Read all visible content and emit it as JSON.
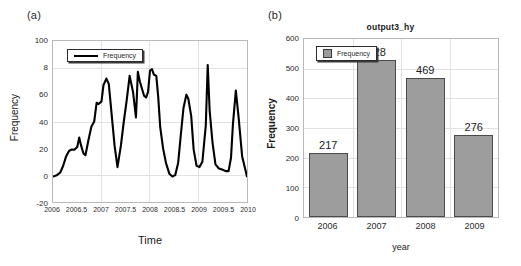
{
  "figure": {
    "panels": [
      {
        "tag": "(a)",
        "title": "",
        "legend_label": "Frequency",
        "xlabel": "Time",
        "ylabel": "Frequency"
      },
      {
        "tag": "(b)",
        "title": "output3_hy",
        "legend_label": "Frequency",
        "xlabel": "year",
        "ylabel": "Frequency"
      }
    ]
  },
  "colors": {
    "line": "#000000",
    "bar_fill": "#9d9d9d",
    "bar_edge": "#4a4a4a",
    "grid": "#e2e2e2",
    "frame": "#b9b9b9",
    "text": "#1a1a1a"
  },
  "chart_data": [
    {
      "type": "line",
      "panel": "(a)",
      "title": "",
      "xlabel": "Time",
      "ylabel": "Frequency",
      "xlim": [
        2006,
        2010
      ],
      "ylim": [
        -20,
        100
      ],
      "xticks": [
        2006,
        2006.5,
        2007,
        2007.5,
        2008,
        2008.5,
        2009,
        2009.5,
        2010
      ],
      "xticklabels": [
        "2006",
        "2006.5",
        "2007",
        "2007.5",
        "2008",
        "2008.5",
        "2009",
        "2009.5",
        "2010"
      ],
      "yticks": [
        -20,
        0,
        20,
        40,
        60,
        8,
        100
      ],
      "yticklabels": [
        "-20",
        "0",
        "20",
        "40",
        "60",
        "8",
        "100"
      ],
      "grid": true,
      "legend": {
        "position": "upper left",
        "entries": [
          "Frequency"
        ]
      },
      "series": [
        {
          "name": "Frequency",
          "x": [
            2006.0,
            2006.08,
            2006.15,
            2006.21,
            2006.27,
            2006.33,
            2006.38,
            2006.44,
            2006.5,
            2006.54,
            2006.58,
            2006.63,
            2006.67,
            2006.73,
            2006.79,
            2006.85,
            2006.9,
            2006.94,
            2007.0,
            2007.04,
            2007.1,
            2007.15,
            2007.21,
            2007.27,
            2007.33,
            2007.4,
            2007.46,
            2007.52,
            2007.58,
            2007.65,
            2007.71,
            2007.75,
            2007.79,
            2007.83,
            2007.88,
            2007.92,
            2007.96,
            2008.0,
            2008.04,
            2008.08,
            2008.13,
            2008.17,
            2008.21,
            2008.27,
            2008.33,
            2008.4,
            2008.46,
            2008.52,
            2008.58,
            2008.63,
            2008.69,
            2008.75,
            2008.79,
            2008.85,
            2008.9,
            2008.96,
            2009.02,
            2009.08,
            2009.15,
            2009.19,
            2009.23,
            2009.29,
            2009.35,
            2009.42,
            2009.5,
            2009.56,
            2009.62,
            2009.67,
            2009.71,
            2009.77,
            2009.83,
            2009.9,
            2010.0
          ],
          "y": [
            -1,
            0,
            2,
            7,
            14,
            18,
            19,
            19,
            21,
            28,
            22,
            16,
            15,
            26,
            36,
            40,
            54,
            53,
            55,
            67,
            72,
            68,
            45,
            22,
            6,
            22,
            40,
            56,
            74,
            62,
            43,
            77,
            70,
            65,
            59,
            58,
            62,
            78,
            79,
            75,
            74,
            58,
            36,
            20,
            9,
            1,
            -1,
            0,
            9,
            28,
            50,
            60,
            57,
            44,
            19,
            7,
            6,
            10,
            37,
            82,
            48,
            24,
            8,
            5,
            4,
            3,
            3,
            13,
            38,
            63,
            42,
            14,
            -1
          ]
        }
      ]
    },
    {
      "type": "bar",
      "panel": "(b)",
      "title": "output3_hy",
      "xlabel": "year",
      "ylabel": "Frequency",
      "categories": [
        "2006",
        "2007",
        "2008",
        "2009"
      ],
      "values": [
        217,
        528,
        469,
        276
      ],
      "value_labels": [
        "217",
        "528",
        "469",
        "276"
      ],
      "ylim": [
        0,
        600
      ],
      "yticks": [
        0,
        100,
        200,
        300,
        400,
        500,
        600
      ],
      "yticklabels": [
        "0",
        "100",
        "200",
        "300",
        "400",
        "500",
        "600"
      ],
      "grid": true,
      "legend": {
        "position": "upper left",
        "entries": [
          "Frequency"
        ]
      }
    }
  ]
}
